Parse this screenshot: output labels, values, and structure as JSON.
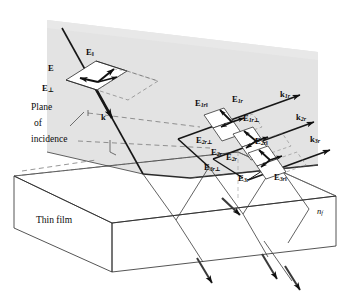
{
  "figure": {
    "colors": {
      "plane_fill": "#e3e3e3",
      "plane_fill_light": "#ececec",
      "line": "#1a1a1a",
      "thin_line": "#555555",
      "box_fill": "#ffffff",
      "background": "#ffffff"
    }
  },
  "labels": {
    "plane_of_incidence": {
      "line1": "Plane",
      "line2": "of",
      "line3": "incidence"
    },
    "thin_film": "Thin film",
    "film_index": {
      "base": "n",
      "sub": "f"
    },
    "incident": {
      "E": "E",
      "E_par": {
        "base": "E",
        "sub": "‖"
      },
      "E_perp": {
        "base": "E",
        "sub": "⊥"
      },
      "k": "k"
    },
    "reflected": [
      {
        "k": {
          "base": "k",
          "sub": "1r"
        },
        "E": {
          "base": "E",
          "sub": "1r"
        },
        "E_par": {
          "base": "E",
          "sub": "1r‖"
        },
        "E_perp": {
          "base": "E",
          "sub": "1r⊥"
        }
      },
      {
        "k": {
          "base": "k",
          "sub": "2r"
        },
        "E": {
          "base": "E",
          "sub": "2r"
        },
        "E_par": {
          "base": "E",
          "sub": "2r‖"
        },
        "E_perp": {
          "base": "E",
          "sub": "2r⊥"
        }
      },
      {
        "k": {
          "base": "k",
          "sub": "3r"
        },
        "E": {
          "base": "E",
          "sub": "3r"
        },
        "E_par": {
          "base": "E",
          "sub": "3r‖"
        },
        "E_perp": {
          "base": "E",
          "sub": "3r⊥"
        }
      }
    ]
  },
  "rendered_text": {
    "plane_line1": "Plane",
    "plane_line2": "of",
    "plane_line3": "incidence",
    "thin_film": "Thin film",
    "n_f_base": "n",
    "n_f_sub": "f",
    "E": "E",
    "E_par_base": "E",
    "E_par_sub": "‖",
    "E_perp_base": "E",
    "E_perp_sub": "⊥",
    "k": "k",
    "k1r_base": "k",
    "k1r_sub": "1r",
    "k2r_base": "k",
    "k2r_sub": "2r",
    "k3r_base": "k",
    "k3r_sub": "3r",
    "E1r_base": "E",
    "E1r_sub": "1r",
    "E1rpar_base": "E",
    "E1rpar_sub": "1r‖",
    "E1rperp_base": "E",
    "E1rperp_sub": "1r⊥",
    "E2r_base": "E",
    "E2r_sub": "2r",
    "E2rpar_base": "E",
    "E2rpar_sub": "2r‖",
    "E2rperp_base": "E",
    "E2rperp_sub": "2r⊥",
    "E3r_base": "E",
    "E3r_sub": "3r",
    "E3rpar_base": "E",
    "E3rpar_sub": "3r‖",
    "E3rperp_base": "E",
    "E3rperp_sub": "3r⊥"
  }
}
